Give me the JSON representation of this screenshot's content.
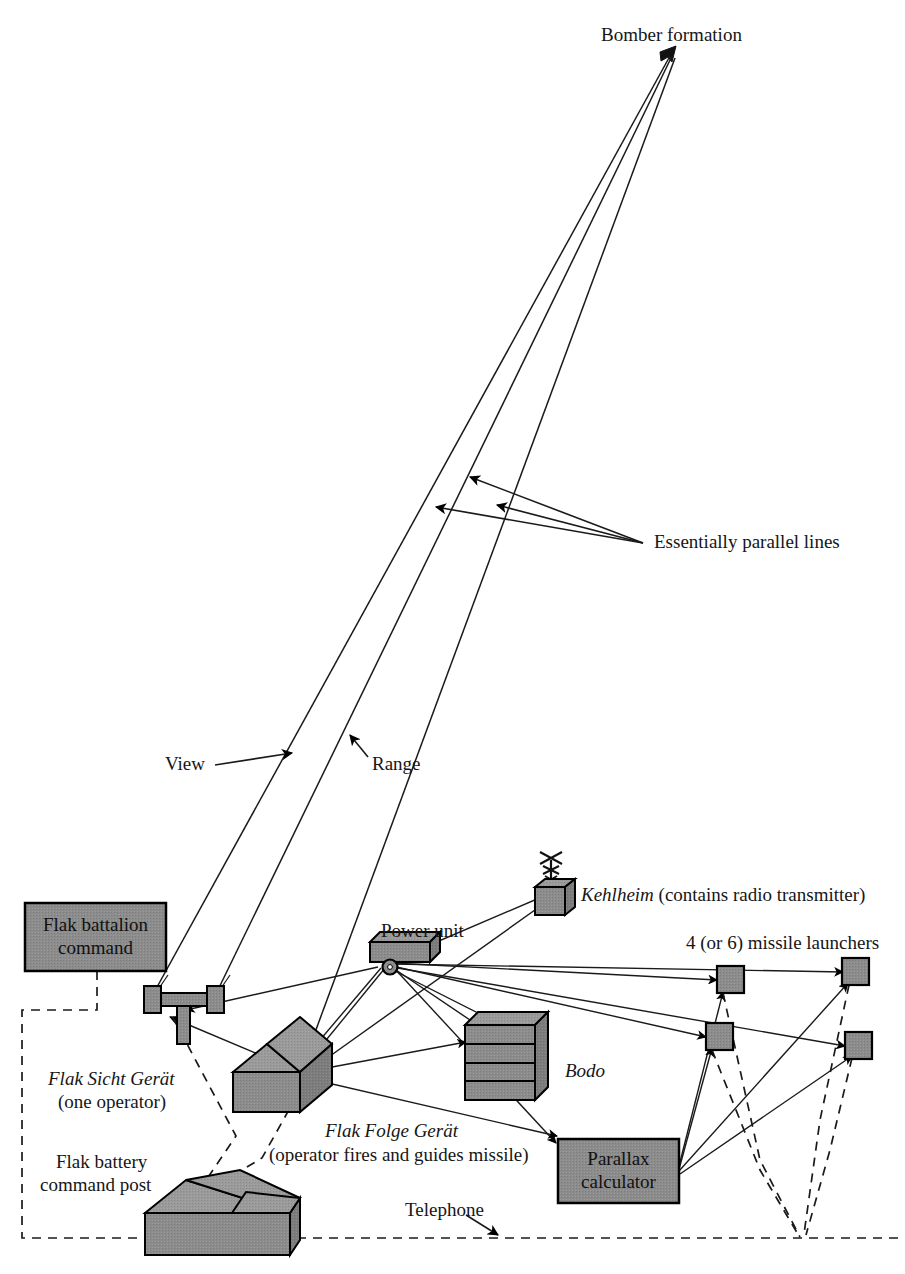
{
  "diagram": {
    "colors": {
      "fill_gray": "#8a8a8a",
      "fill_gray_dark": "#787878",
      "fill_gray_light": "#9a9a9a",
      "stroke": "#000000",
      "background": "#ffffff"
    },
    "labels": {
      "bomber_formation": "Bomber formation",
      "essentially_parallel_lines": "Essentially parallel lines",
      "view": "View",
      "range": "Range",
      "power_unit": "Power unit",
      "kehlheim_name": "Kehlheim",
      "kehlheim_note": " (contains radio transmitter)",
      "missile_launchers": "4 (or 6) missile launchers",
      "flak_battalion_command": [
        "Flak battalion",
        "command"
      ],
      "flak_sicht_gerat_name": "Flak Sicht Gerät",
      "flak_sicht_gerat_note": "(one operator)",
      "bodo": "Bodo",
      "flak_folge_gerat_name": "Flak Folge Gerät",
      "flak_folge_gerat_note": "(operator fires and guides missile)",
      "flak_battery_command_post": [
        "Flak battery",
        "command post"
      ],
      "parallax_calculator": [
        "Parallax",
        "calculator"
      ],
      "telephone": "Telephone"
    },
    "elements": {
      "bomber_formation": {
        "name": "bomber-formation-icon"
      },
      "kehlheim": {
        "name": "kehlheim-radio-box"
      },
      "power_unit": {
        "name": "power-unit-trailer"
      },
      "bodo": {
        "name": "bodo-cabinet"
      },
      "flak_sicht_gerat": {
        "name": "flak-sicht-gerat-device"
      },
      "flak_folge_gerat": {
        "name": "flak-folge-gerat-hut"
      },
      "command_post": {
        "name": "flak-battery-command-post-hut"
      },
      "launchers": [
        "launcher-1",
        "launcher-2",
        "launcher-3",
        "launcher-4"
      ]
    },
    "line_types": {
      "solid": "cable / sight line",
      "dashed": "telephone line"
    }
  }
}
